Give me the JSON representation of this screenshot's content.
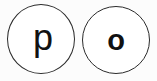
{
  "canvas": {
    "width": 157,
    "height": 81,
    "background_color": "#fcfcfc"
  },
  "style": {
    "circle_stroke_color": "#2b2b2b",
    "circle_fill_color": "#ffffff",
    "glyph_color": "#111111"
  },
  "circles": [
    {
      "id": "circle-p",
      "letter": "p",
      "weight": "regular"
    },
    {
      "id": "circle-o",
      "letter": "o",
      "weight": "bold"
    }
  ]
}
